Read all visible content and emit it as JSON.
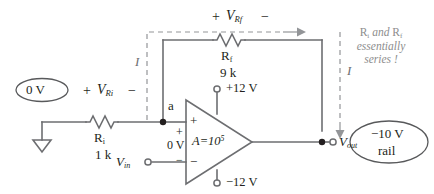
{
  "diagram": {
    "type": "op-amp inverting amplifier circuit",
    "source": {
      "value": "0 V",
      "ground_symbol": "earth-ground"
    },
    "input_resistor": {
      "name_main": "R",
      "name_sub": "i",
      "value": "1 k",
      "polarity_left": "+",
      "polarity_right": "−",
      "voltage_main": "V",
      "voltage_sub": "Ri"
    },
    "feedback_resistor": {
      "name_main": "R",
      "name_sub": "f",
      "value": "9 k",
      "polarity_left": "+",
      "polarity_right": "−",
      "voltage_main": "V",
      "voltage_sub": "Rf"
    },
    "node_a": "a",
    "opamp": {
      "gain_label": "A=10",
      "gain_exp": "5",
      "plus_input": "+",
      "minus_input": "−",
      "diff_plus": "+",
      "diff_minus": "−",
      "diff_voltage": "0 V",
      "supply_positive": "+12 V",
      "supply_negative": "−12 V"
    },
    "vin": {
      "main": "V",
      "sub": "in"
    },
    "vout": {
      "main": "V",
      "sub": "out"
    },
    "output_bubble": {
      "line1": "−10 V",
      "line2": "rail"
    },
    "current_left": "I",
    "current_right": "I",
    "annotation": {
      "line1_a": "R",
      "line1_a_sub": "i",
      "line1_mid": " and ",
      "line1_b": "R",
      "line1_b_sub": "f",
      "line2": "essentially",
      "line3": "series !"
    },
    "colors": {
      "wire": "#6d6e71",
      "text": "#231f20",
      "note": "#8d8d8d",
      "background": "#ffffff"
    }
  }
}
